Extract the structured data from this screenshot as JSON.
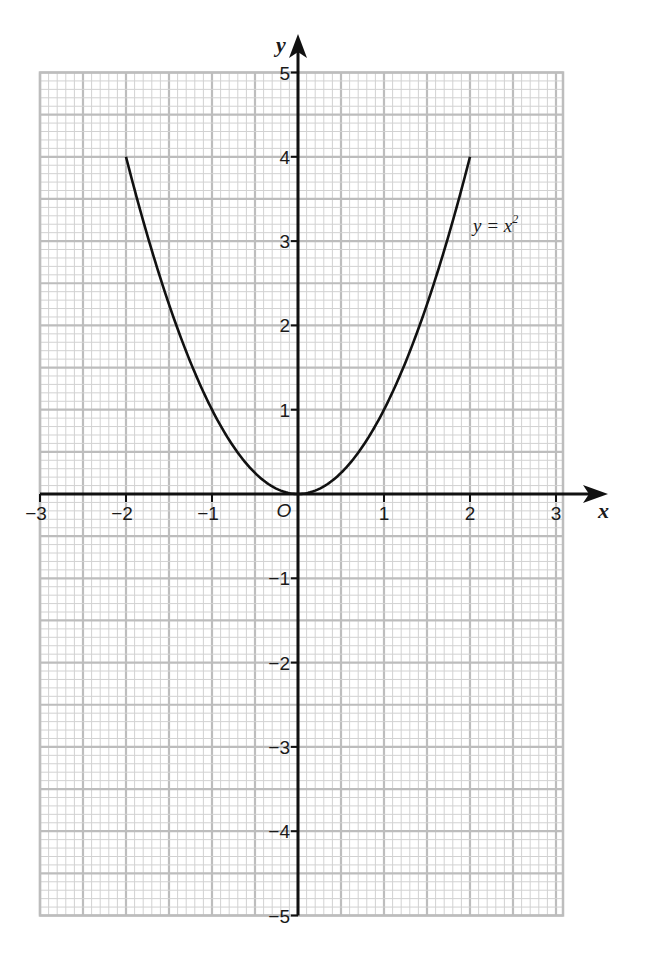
{
  "chart_data": {
    "type": "line",
    "title": "",
    "xlabel": "x",
    "ylabel": "y",
    "xlim": [
      -3,
      3
    ],
    "ylim": [
      -5,
      5
    ],
    "grid": true,
    "grid_minor_step": 0.1,
    "grid_major_step": 0.5,
    "x_ticks": [
      -3,
      -2,
      -1,
      0,
      1,
      2,
      3
    ],
    "x_tick_labels": [
      "−3",
      "−2",
      "−1",
      "",
      "1",
      "2",
      "3"
    ],
    "y_ticks": [
      -5,
      -4,
      -3,
      -2,
      -1,
      1,
      2,
      3,
      4,
      5
    ],
    "y_tick_labels": [
      "−5",
      "−4",
      "−3",
      "−2",
      "−1",
      "1",
      "2",
      "3",
      "4",
      "5"
    ],
    "origin_label": "O",
    "series": [
      {
        "name": "y = x²",
        "function": "x^2",
        "x_range": [
          -2,
          2
        ],
        "x": [
          -2,
          -1.5,
          -1,
          -0.5,
          0,
          0.5,
          1,
          1.5,
          2
        ],
        "y": [
          4,
          2.25,
          1,
          0.25,
          0,
          0.25,
          1,
          2.25,
          4
        ],
        "annotation": {
          "text_main": "y = x",
          "superscript": "2",
          "x": 2.05,
          "y": 3.2
        }
      }
    ],
    "colors": {
      "grid_minor": "#d2d2d2",
      "grid_major": "#bdbdbd",
      "axis": "#111111",
      "curve": "#111111"
    }
  }
}
